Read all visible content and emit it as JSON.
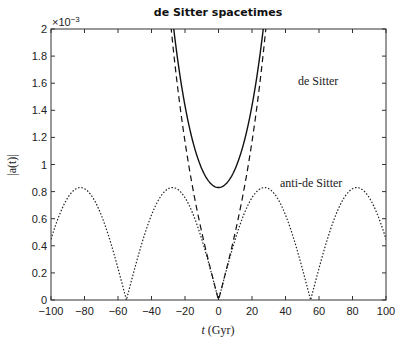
{
  "chart_data": {
    "type": "line",
    "title": "de Sitter spacetimes",
    "xlabel": "t (Gyr)",
    "ylabel": "|a(t)|",
    "y_multiplier": "×10^-3",
    "xlim": [
      -100,
      100
    ],
    "ylim": [
      0,
      0.002
    ],
    "xticks": [
      -100,
      -80,
      -60,
      -40,
      -20,
      0,
      20,
      40,
      60,
      80,
      100
    ],
    "yticks": [
      0,
      0.2,
      0.4,
      0.6,
      0.8,
      1,
      1.2,
      1.4,
      1.6,
      1.8,
      2
    ],
    "grid": false,
    "legend": "inline annotations",
    "series": [
      {
        "name": "de Sitter",
        "style": "solid",
        "model": "a0*cosh(t/tau)",
        "a0": 0.00083,
        "tau": 17.5,
        "x": [
          -30,
          -25,
          -20,
          -15,
          -10,
          -5,
          0,
          5,
          10,
          15,
          20,
          25,
          30
        ],
        "values": [
          0.00237,
          0.00183,
          0.00144,
          0.00116,
          0.00097,
          0.00086,
          0.00083,
          0.00086,
          0.00097,
          0.00116,
          0.00144,
          0.00183,
          0.00237
        ]
      },
      {
        "name": "de Sitter (flat, dashed)",
        "style": "dashed",
        "model": "a0*|sinh(t/tau)|",
        "a0": 0.00083,
        "tau": 17.5,
        "x": [
          -30,
          -25,
          -20,
          -15,
          -10,
          -5,
          0,
          5,
          10,
          15,
          20,
          25,
          30
        ],
        "values": [
          0.00225,
          0.00167,
          0.00117,
          0.0008,
          0.0005,
          0.00024,
          0,
          0.00024,
          0.0005,
          0.0008,
          0.00117,
          0.00167,
          0.00225
        ]
      },
      {
        "name": "anti-de Sitter",
        "style": "dotted",
        "model": "A*|sin(pi*t/55)|",
        "A": 0.00083,
        "period_half": 55,
        "x": [
          -100,
          -82.5,
          -55,
          -27.5,
          0,
          27.5,
          55,
          82.5,
          100
        ],
        "values": [
          0.00045,
          0.00083,
          0,
          0.00083,
          0,
          0.00083,
          0,
          0.00083,
          0.00045
        ]
      }
    ],
    "annotations": [
      {
        "text": "de Sitter",
        "x": 40,
        "y": 0.00168
      },
      {
        "text": "anti-de Sitter",
        "x": 55,
        "y": 0.00084
      }
    ]
  },
  "labels": {
    "title": "de Sitter spacetimes",
    "xlabel_var": "t",
    "xlabel_unit": "(Gyr)",
    "ylabel": "|a(t)|",
    "multiplier": "×10",
    "multiplier_exp": "−3",
    "ann_ds": "de Sitter",
    "ann_ads": "anti-de Sitter"
  }
}
